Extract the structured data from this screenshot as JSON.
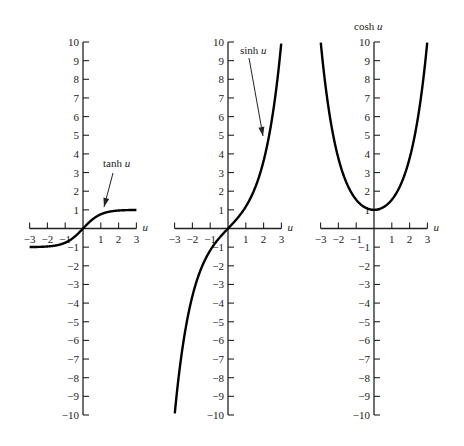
{
  "chart_data": [
    {
      "type": "line",
      "title": "tanh u",
      "xlabel": "u",
      "x_ticks": [
        -3,
        -2,
        -1,
        1,
        2,
        3
      ],
      "y_ticks": [
        -10,
        -9,
        -8,
        -7,
        -6,
        -5,
        -4,
        -3,
        -2,
        -1,
        1,
        2,
        3,
        4,
        5,
        6,
        7,
        8,
        9,
        10
      ],
      "xlim": [
        -3,
        3
      ],
      "ylim": [
        -10,
        10
      ],
      "annotation": "tanh u",
      "function": "tanh",
      "x": [
        -3,
        -2,
        -1,
        0,
        1,
        2,
        3
      ],
      "values": [
        -0.995,
        -0.964,
        -0.762,
        0,
        0.762,
        0.964,
        0.995
      ]
    },
    {
      "type": "line",
      "title": "sinh u",
      "xlabel": "u",
      "x_ticks": [
        -3,
        -2,
        -1,
        1,
        2,
        3
      ],
      "y_ticks": [
        -10,
        -9,
        -8,
        -7,
        -6,
        -5,
        -4,
        -3,
        -2,
        -1,
        1,
        2,
        3,
        4,
        5,
        6,
        7,
        8,
        9,
        10
      ],
      "xlim": [
        -3,
        3
      ],
      "ylim": [
        -10,
        10
      ],
      "annotation": "sinh u",
      "function": "sinh",
      "x": [
        -3,
        -2,
        -1,
        0,
        1,
        2,
        3
      ],
      "values": [
        -10.02,
        -3.63,
        -1.18,
        0,
        1.18,
        3.63,
        10.02
      ]
    },
    {
      "type": "line",
      "title": "cosh u",
      "xlabel": "u",
      "x_ticks": [
        -3,
        -2,
        -1,
        1,
        2,
        3
      ],
      "y_ticks": [
        -10,
        -9,
        -8,
        -7,
        -6,
        -5,
        -4,
        -3,
        -2,
        -1,
        1,
        2,
        3,
        4,
        5,
        6,
        7,
        8,
        9,
        10
      ],
      "xlim": [
        -3,
        3
      ],
      "ylim": [
        -10,
        10
      ],
      "annotation": "cosh u",
      "function": "cosh",
      "x": [
        -3,
        -2,
        -1,
        0,
        1,
        2,
        3
      ],
      "values": [
        10.07,
        3.76,
        1.54,
        1,
        1.54,
        3.76,
        10.07
      ]
    }
  ],
  "panels": [
    {
      "origin_x": 83,
      "annotation": "tanh u",
      "func": "tanh"
    },
    {
      "origin_x": 228,
      "annotation": "sinh u",
      "func": "sinh"
    },
    {
      "origin_x": 374,
      "annotation": "cosh u",
      "func": "cosh"
    }
  ],
  "layout": {
    "origin_y": 228.5,
    "px_per_unit_x": 17.8,
    "px_per_unit_y": 18.65
  },
  "axis_label": "u"
}
